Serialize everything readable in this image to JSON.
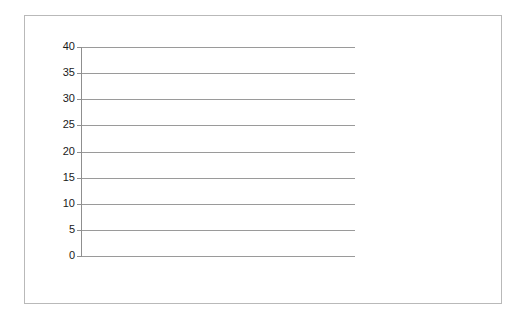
{
  "chart_data": {
    "type": "line",
    "title": "",
    "subtitle": "",
    "xlabel": "",
    "ylabel": "",
    "ylim": [
      0,
      40
    ],
    "y_ticks": [
      0,
      5,
      10,
      15,
      20,
      25,
      30,
      35,
      40
    ],
    "grid": true,
    "legend_position": "right",
    "categories": [
      "Baseline",
      "2/3/2011",
      "2/8/2011",
      "2/10/2011",
      "2/15/2011",
      "2/17/2011",
      "2/22/2011",
      "2/24/2011",
      "3/1/2011",
      "3/3/2011",
      "3/8/2011",
      "3/10/2011"
    ],
    "series": [
      {
        "name": "Carrie Dunn - CBM Progress Monitoring (Instructional Level 1.5)",
        "color": "#3d3d3d",
        "width": 3,
        "values": [
          26,
          25,
          29,
          29,
          31,
          33,
          33,
          35,
          36,
          34,
          37,
          null
        ]
      },
      {
        "name": "Aimline",
        "color": "#e2e2e2",
        "width": 3,
        "values": [
          26,
          28,
          29.1,
          30.2,
          31.3,
          32.4,
          33.2,
          34.2,
          35.2,
          36.1,
          37.5,
          38
        ]
      }
    ]
  },
  "legend": {
    "items": [
      {
        "label": "Carrie Dunn - CBM Progress Monitoring (Instructional Level 1.5)",
        "color": "#3d3d3d",
        "style": "thick"
      },
      {
        "label": "Aimline",
        "color": "#e2e2e2",
        "style": "thin"
      }
    ]
  },
  "axes": {
    "y_tick_labels": [
      "40",
      "35",
      "30",
      "25",
      "20",
      "15",
      "10",
      "5",
      "0"
    ],
    "x_tick_labels": [
      "Baseline",
      "2/3/2011",
      "2/8/2011",
      "2/10/2011",
      "2/15/2011",
      "2/17/2011",
      "2/22/2011",
      "2/24/2011",
      "3/1/2011",
      "3/3/2011",
      "3/8/2011",
      "3/10/2011"
    ]
  },
  "colors": {
    "series_primary": "#3d3d3d",
    "series_aimline": "#e2e2e2",
    "gridline": "#9a9a9a",
    "axis": "#8f8f8f",
    "frame_border": "#b9b9b9",
    "text": "#1a1a1a",
    "background": "#ffffff"
  }
}
